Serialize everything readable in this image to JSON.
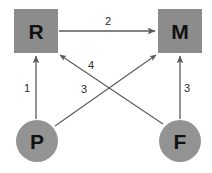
{
  "diagram": {
    "type": "node-edge-graph",
    "background_color": "#ffffff",
    "node_fill_color": "#8c8c8c",
    "edge_color": "#5a5a5a",
    "label_color": "#2b2b2b",
    "nodes": [
      {
        "id": "R",
        "label": "R",
        "shape": "square"
      },
      {
        "id": "M",
        "label": "M",
        "shape": "square"
      },
      {
        "id": "P",
        "label": "P",
        "shape": "circle"
      },
      {
        "id": "F",
        "label": "F",
        "shape": "circle"
      }
    ],
    "edges": [
      {
        "id": "e1",
        "from": "P",
        "to": "R",
        "label": "1"
      },
      {
        "id": "e2",
        "from": "R",
        "to": "M",
        "label": "2"
      },
      {
        "id": "e4",
        "from": "F",
        "to": "R",
        "label": "4"
      },
      {
        "id": "e3a",
        "from": "P",
        "to": "M",
        "label": "3"
      },
      {
        "id": "e3b",
        "from": "F",
        "to": "M",
        "label": "3"
      }
    ]
  }
}
